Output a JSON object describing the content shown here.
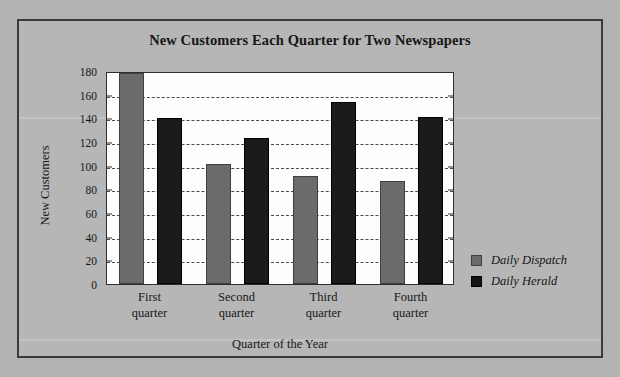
{
  "chart_data": {
    "type": "bar",
    "title": "New Customers Each Quarter for Two Newspapers",
    "xlabel": "Quarter of the Year",
    "ylabel": "New Customers",
    "categories": [
      "First quarter",
      "Second quarter",
      "Third quarter",
      "Fourth quarter"
    ],
    "category_lines": [
      [
        "First",
        "quarter"
      ],
      [
        "Second",
        "quarter"
      ],
      [
        "Third",
        "quarter"
      ],
      [
        "Fourth",
        "quarter"
      ]
    ],
    "series": [
      {
        "name": "Daily Dispatch",
        "color": "#6b6b6b",
        "values": [
          178,
          101,
          91,
          87
        ]
      },
      {
        "name": "Daily Herald",
        "color": "#1b1b1b",
        "values": [
          140,
          123,
          154,
          141
        ]
      }
    ],
    "ylim": [
      0,
      180
    ],
    "ytick_step": 20,
    "yticks": [
      0,
      20,
      40,
      60,
      80,
      100,
      120,
      140,
      160,
      180
    ],
    "ytick_labels": [
      "0",
      "20",
      "40",
      "60",
      "80",
      "100",
      "120",
      "140",
      "160",
      "180"
    ],
    "grid": true,
    "grid_style": "dashed",
    "grid_axis": "y",
    "legend_position": "right-bottom",
    "legend_entries": [
      "Daily Dispatch",
      "Daily Herald"
    ]
  },
  "figure": {
    "background_color": "#b6b6b6",
    "plot_background_color": "#fdfdfd",
    "border_color": "#3a3a3a",
    "text_color": "#161616"
  }
}
